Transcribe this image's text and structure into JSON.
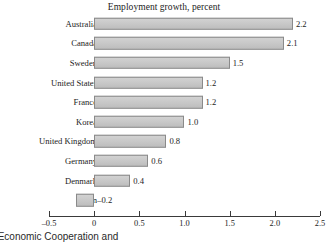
{
  "chart_data": {
    "type": "bar",
    "orientation": "horizontal",
    "title": "Employment growth, percent",
    "xlabel": "",
    "ylabel": "",
    "categories": [
      "Australia",
      "Canada",
      "Sweden",
      "United States",
      "France",
      "Korea",
      "United Kingdom",
      "Germany",
      "Denmark",
      "Japan"
    ],
    "values": [
      2.2,
      2.1,
      1.5,
      1.2,
      1.2,
      1.0,
      0.8,
      0.6,
      0.4,
      -0.2
    ],
    "value_labels": [
      "2.2",
      "2.1",
      "1.5",
      "1.2",
      "1.2",
      "1.0",
      "0.8",
      "0.6",
      "0.4",
      "–0.2"
    ],
    "xlim": [
      -0.5,
      2.5
    ],
    "xticks": [
      -0.5,
      0,
      0.5,
      1.0,
      1.5,
      2.0,
      2.5
    ],
    "xtick_labels": [
      "–0.5",
      "0",
      "0.5",
      "1.0",
      "1.5",
      "2.0",
      "2.5"
    ],
    "grid": false,
    "legend": null,
    "bar_fill_color": "#c9c9c9",
    "bar_border_color": "#8a8a8a",
    "axis_color": "#3a3a3a"
  },
  "footer": {
    "caption": "or Economic Cooperation and"
  }
}
